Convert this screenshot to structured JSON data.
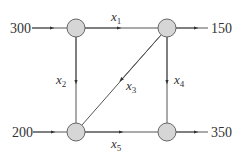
{
  "diagram": {
    "type": "network-flow",
    "nodes": [
      {
        "id": "A",
        "position": "top-left"
      },
      {
        "id": "B",
        "position": "top-right"
      },
      {
        "id": "C",
        "position": "bottom-left"
      },
      {
        "id": "D",
        "position": "bottom-right"
      }
    ],
    "external_flows": {
      "in_top_left": "300",
      "out_top_right": "150",
      "in_bottom_left": "200",
      "out_bottom_right": "350"
    },
    "edges": [
      {
        "var": "x",
        "sub": "1",
        "from": "A",
        "to": "B"
      },
      {
        "var": "x",
        "sub": "2",
        "from": "A",
        "to": "C"
      },
      {
        "var": "x",
        "sub": "3",
        "from": "B",
        "to": "C"
      },
      {
        "var": "x",
        "sub": "4",
        "from": "B",
        "to": "D"
      },
      {
        "var": "x",
        "sub": "5",
        "from": "C",
        "to": "D"
      }
    ],
    "colors": {
      "node_fill": "#d6d6d6",
      "stroke": "#555555",
      "text": "#333333"
    }
  }
}
